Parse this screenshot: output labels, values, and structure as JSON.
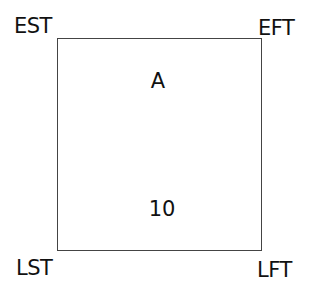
{
  "node": {
    "corners": {
      "top_left": "EST",
      "top_right": "EFT",
      "bottom_left": "LST",
      "bottom_right": "LFT"
    },
    "activity": "A",
    "duration": "10"
  }
}
